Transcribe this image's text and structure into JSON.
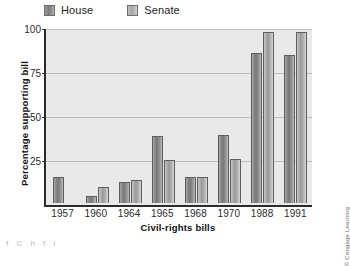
{
  "legend": {
    "items": [
      {
        "label": "House",
        "key": "house",
        "color": "#7d7d7d"
      },
      {
        "label": "Senate",
        "key": "senate",
        "color": "#a6a6a6"
      }
    ]
  },
  "credit": "© Cengage Learning",
  "page_bleed": "f     C        h   f          l",
  "chart_data": {
    "type": "bar",
    "title": "",
    "xlabel": "Civil-rights bills",
    "ylabel": "Percentage supporting bill",
    "categories": [
      "1957",
      "1960",
      "1964",
      "1965",
      "1968",
      "1970",
      "1988",
      "1991"
    ],
    "series": [
      {
        "name": "House",
        "values": [
          15,
          4,
          12,
          38.5,
          15,
          39,
          86,
          85
        ]
      },
      {
        "name": "Senate",
        "values": [
          0,
          9,
          13,
          25,
          15,
          25.5,
          98.5,
          98.5
        ]
      }
    ],
    "ylim": [
      0,
      100
    ],
    "yticks": [
      25,
      50,
      75,
      100
    ],
    "ytick_labels": [
      "25",
      "50",
      "75",
      "100"
    ],
    "grid": true,
    "legend_position": "top-left",
    "colors": {
      "house": "#7d7d7d",
      "senate": "#a6a6a6",
      "plot_background": "#e9e9e9",
      "gridline": "#bdbdbd",
      "axis": "#2b2b2b"
    }
  }
}
